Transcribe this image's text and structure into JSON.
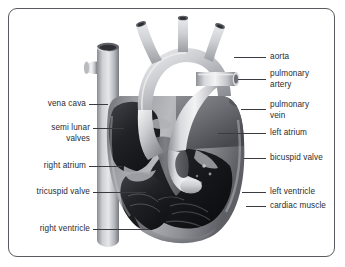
{
  "figure": {
    "background_color": "#ffffff",
    "frame_color": "#5a5a60",
    "label_color": "#2b2b30",
    "leader_color": "#3a3a40"
  },
  "labels": {
    "left": [
      {
        "id": "vena-cava",
        "text": "vena cava",
        "lines": [
          "vena cava"
        ]
      },
      {
        "id": "semi-lunar-valves",
        "text": "semi lunar valves",
        "lines": [
          "semi lunar",
          "valves"
        ]
      },
      {
        "id": "right-atrium",
        "text": "right atrium",
        "lines": [
          "right atrium"
        ]
      },
      {
        "id": "tricuspid-valve",
        "text": "tricuspid valve",
        "lines": [
          "tricuspid valve"
        ]
      },
      {
        "id": "right-ventricle",
        "text": "right ventricle",
        "lines": [
          "right ventricle"
        ]
      }
    ],
    "right": [
      {
        "id": "aorta",
        "text": "aorta",
        "lines": [
          "aorta"
        ]
      },
      {
        "id": "pulmonary-artery",
        "text": "pulmonary artery",
        "lines": [
          "pulmonary",
          "artery"
        ]
      },
      {
        "id": "pulmonary-vein",
        "text": "pulmonary vein",
        "lines": [
          "pulmonary",
          "vein"
        ]
      },
      {
        "id": "left-atrium",
        "text": "left atrium",
        "lines": [
          "left atrium"
        ]
      },
      {
        "id": "bicuspid-valve",
        "text": "bicuspid valve",
        "lines": [
          "bicuspid valve"
        ]
      },
      {
        "id": "left-ventricle",
        "text": "left ventricle",
        "lines": [
          "left ventricle"
        ]
      },
      {
        "id": "cardiac-muscle",
        "text": "cardiac muscle",
        "lines": [
          "cardiac muscle"
        ]
      }
    ]
  },
  "label_text": {
    "vena_cava": "vena cava",
    "semi_lunar_1": "semi lunar",
    "semi_lunar_2": "valves",
    "right_atrium": "right atrium",
    "tricuspid_valve": "tricuspid valve",
    "right_ventricle": "right ventricle",
    "aorta": "aorta",
    "pulmonary_artery_1": "pulmonary",
    "pulmonary_artery_2": "artery",
    "pulmonary_vein_1": "pulmonary",
    "pulmonary_vein_2": "vein",
    "left_atrium": "left atrium",
    "bicuspid_valve": "bicuspid valve",
    "left_ventricle": "left ventricle",
    "cardiac_muscle": "cardiac muscle"
  }
}
